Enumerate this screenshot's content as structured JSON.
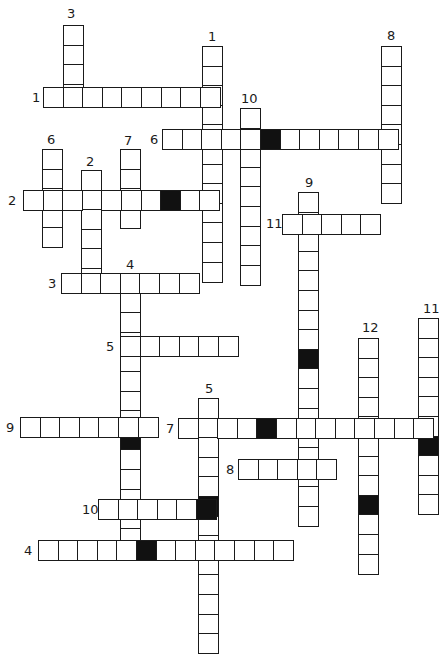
{
  "puzzle": {
    "title": "Crossword",
    "cell_size": 19.6,
    "colors": {
      "line": "#1a1a1a",
      "block": "#111111",
      "background": "#ffffff"
    },
    "entries": [
      {
        "id": "3-down",
        "number": "3",
        "direction": "down",
        "x": 63,
        "y": 25,
        "length": 4,
        "blocks": [],
        "label_x": 67,
        "label_y": 7
      },
      {
        "id": "1-down",
        "number": "1",
        "direction": "down",
        "x": 202,
        "y": 46,
        "length": 12,
        "blocks": [],
        "label_x": 208,
        "label_y": 30
      },
      {
        "id": "8-down",
        "number": "8",
        "direction": "down",
        "x": 381,
        "y": 46,
        "length": 8,
        "blocks": [],
        "label_x": 387,
        "label_y": 29
      },
      {
        "id": "1-across",
        "number": "1",
        "direction": "across",
        "x": 43,
        "y": 87,
        "length": 9,
        "blocks": [],
        "label_x": 32,
        "label_y": 91
      },
      {
        "id": "10-down",
        "number": "10",
        "direction": "down",
        "x": 240,
        "y": 108,
        "length": 9,
        "blocks": [],
        "label_x": 241,
        "label_y": 92
      },
      {
        "id": "6-across",
        "number": "6",
        "direction": "across",
        "x": 162,
        "y": 129,
        "length": 12,
        "blocks": [
          5
        ],
        "label_x": 150,
        "label_y": 133
      },
      {
        "id": "6-down",
        "number": "6",
        "direction": "down",
        "x": 42,
        "y": 149,
        "length": 5,
        "blocks": [],
        "label_x": 47,
        "label_y": 133
      },
      {
        "id": "7-down",
        "number": "7",
        "direction": "down",
        "x": 120,
        "y": 149,
        "length": 4,
        "blocks": [],
        "label_x": 124,
        "label_y": 134
      },
      {
        "id": "2-down",
        "number": "2",
        "direction": "down",
        "x": 81,
        "y": 170,
        "length": 6,
        "blocks": [],
        "label_x": 86,
        "label_y": 155
      },
      {
        "id": "2-across",
        "number": "2",
        "direction": "across",
        "x": 23,
        "y": 190,
        "length": 10,
        "blocks": [
          7
        ],
        "label_x": 8,
        "label_y": 194
      },
      {
        "id": "9-down",
        "number": "9",
        "direction": "down",
        "x": 298,
        "y": 192,
        "length": 17,
        "blocks": [
          8
        ],
        "label_x": 305,
        "label_y": 176
      },
      {
        "id": "11-across",
        "number": "11",
        "direction": "across",
        "x": 282,
        "y": 214,
        "length": 5,
        "blocks": [],
        "label_x": 266,
        "label_y": 217
      },
      {
        "id": "3-across",
        "number": "3",
        "direction": "across",
        "x": 61,
        "y": 273,
        "length": 7,
        "blocks": [],
        "label_x": 48,
        "label_y": 277
      },
      {
        "id": "4-down",
        "number": "4",
        "direction": "down",
        "x": 120,
        "y": 273,
        "length": 14,
        "blocks": [
          8
        ],
        "label_x": 126,
        "label_y": 258
      },
      {
        "id": "11-down",
        "number": "11",
        "direction": "down",
        "x": 418,
        "y": 318,
        "length": 10,
        "blocks": [
          6
        ],
        "label_x": 423,
        "label_y": 302
      },
      {
        "id": "5-across",
        "number": "5",
        "direction": "across",
        "x": 120,
        "y": 336,
        "length": 6,
        "blocks": [],
        "label_x": 106,
        "label_y": 340
      },
      {
        "id": "12-down",
        "number": "12",
        "direction": "down",
        "x": 358,
        "y": 338,
        "length": 12,
        "blocks": [
          8
        ],
        "label_x": 362,
        "label_y": 321
      },
      {
        "id": "5-down",
        "number": "5",
        "direction": "down",
        "x": 198,
        "y": 398,
        "length": 13,
        "blocks": [
          5
        ],
        "label_x": 205,
        "label_y": 382
      },
      {
        "id": "9-across",
        "number": "9",
        "direction": "across",
        "x": 20,
        "y": 417,
        "length": 7,
        "blocks": [],
        "label_x": 6,
        "label_y": 421
      },
      {
        "id": "7-across",
        "number": "7",
        "direction": "across",
        "x": 178,
        "y": 418,
        "length": 13,
        "blocks": [
          4
        ],
        "label_x": 166,
        "label_y": 422
      },
      {
        "id": "8-across",
        "number": "8",
        "direction": "across",
        "x": 238,
        "y": 459,
        "length": 5,
        "blocks": [],
        "label_x": 226,
        "label_y": 463
      },
      {
        "id": "10-across",
        "number": "10",
        "direction": "across",
        "x": 98,
        "y": 499,
        "length": 6,
        "blocks": [
          5
        ],
        "label_x": 82,
        "label_y": 503
      },
      {
        "id": "4-across",
        "number": "4",
        "direction": "across",
        "x": 38,
        "y": 540,
        "length": 13,
        "blocks": [
          5
        ],
        "label_x": 24,
        "label_y": 544
      }
    ]
  }
}
